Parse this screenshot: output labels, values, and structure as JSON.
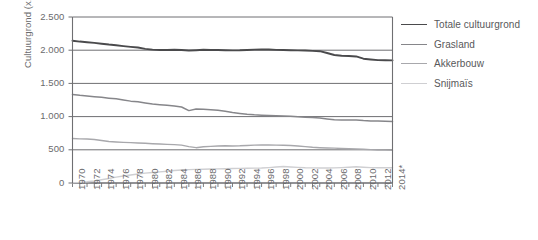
{
  "chart_data": {
    "type": "line",
    "title": "",
    "xlabel": "",
    "ylabel": "Cultuurgrond (x1.000 ha)",
    "ylim": [
      0,
      2500
    ],
    "ytick_labels": [
      "0",
      "500",
      "1.000",
      "1.500",
      "2.000",
      "2.500"
    ],
    "ytick_values": [
      0,
      500,
      1000,
      1500,
      2000,
      2500
    ],
    "grid": true,
    "legend_position": "right",
    "xlim": [
      1970,
      2014
    ],
    "x": [
      1970,
      1971,
      1972,
      1973,
      1974,
      1975,
      1976,
      1977,
      1978,
      1979,
      1980,
      1981,
      1982,
      1983,
      1984,
      1985,
      1986,
      1987,
      1988,
      1989,
      1990,
      1991,
      1992,
      1993,
      1994,
      1995,
      1996,
      1997,
      1998,
      1999,
      2000,
      2001,
      2002,
      2003,
      2004,
      2005,
      2006,
      2007,
      2008,
      2009,
      2010,
      2011,
      2012,
      2013,
      2014
    ],
    "xtick_labels": [
      "1970",
      "1971",
      "1972",
      "1973",
      "1974",
      "1975",
      "1976",
      "1977",
      "1978",
      "1979",
      "1980",
      "1981",
      "1982",
      "1983",
      "1984",
      "1985",
      "1986",
      "1987",
      "1988",
      "1989",
      "1990",
      "1991",
      "1992",
      "1993",
      "1994",
      "1995",
      "1996",
      "1997",
      "1998",
      "1999",
      "2000",
      "2001",
      "2002",
      "2003",
      "2004",
      "2005",
      "2006",
      "2007",
      "2008",
      "2009",
      "2010",
      "2011",
      "2012",
      "2013",
      "2014*"
    ],
    "xtick_labels_shown": [
      "1970",
      "1972",
      "1974",
      "1976",
      "1978",
      "1980",
      "1982",
      "1984",
      "1986",
      "1988",
      "1990",
      "1992",
      "1994",
      "1996",
      "1998",
      "2000",
      "2002",
      "2004",
      "2006",
      "2008",
      "2010",
      "2012",
      "2014*"
    ],
    "series": [
      {
        "name": "Totale cultuurgrond",
        "color": "#4a4a4c",
        "width": 1.9,
        "values": [
          2143,
          2130,
          2120,
          2110,
          2098,
          2085,
          2075,
          2062,
          2050,
          2040,
          2020,
          2008,
          2002,
          2004,
          2006,
          2003,
          1995,
          2000,
          2006,
          2003,
          2003,
          2000,
          1998,
          1999,
          2003,
          2008,
          2012,
          2010,
          2005,
          2003,
          2000,
          1998,
          1995,
          1990,
          1985,
          1958,
          1928,
          1917,
          1912,
          1906,
          1872,
          1861,
          1850,
          1848,
          1847
        ]
      },
      {
        "name": "Grasland",
        "color": "#86868a",
        "width": 1.5,
        "values": [
          1333,
          1320,
          1310,
          1300,
          1290,
          1278,
          1268,
          1250,
          1233,
          1222,
          1205,
          1190,
          1180,
          1170,
          1160,
          1145,
          1090,
          1113,
          1110,
          1105,
          1095,
          1080,
          1062,
          1048,
          1035,
          1026,
          1022,
          1018,
          1012,
          1008,
          1005,
          998,
          992,
          985,
          978,
          965,
          952,
          948,
          950,
          948,
          940,
          935,
          932,
          930,
          928
        ]
      },
      {
        "name": "Akkerbouw",
        "color": "#a8a8ac",
        "width": 1.4,
        "values": [
          670,
          665,
          662,
          655,
          640,
          625,
          618,
          612,
          608,
          602,
          598,
          592,
          588,
          582,
          578,
          570,
          548,
          532,
          545,
          552,
          558,
          560,
          558,
          560,
          565,
          570,
          573,
          572,
          570,
          568,
          565,
          558,
          548,
          538,
          532,
          528,
          525,
          520,
          515,
          512,
          508,
          502,
          498,
          495,
          492
        ]
      },
      {
        "name": "Snijmaïs",
        "color": "#cfcfd2",
        "width": 1.4,
        "values": [
          5,
          10,
          18,
          30,
          48,
          68,
          88,
          105,
          120,
          135,
          148,
          158,
          168,
          178,
          188,
          196,
          202,
          205,
          208,
          210,
          212,
          215,
          218,
          220,
          222,
          224,
          226,
          232,
          240,
          248,
          242,
          236,
          230,
          228,
          226,
          226,
          228,
          232,
          238,
          244,
          238,
          232,
          230,
          230,
          230
        ]
      }
    ]
  },
  "legend": {
    "items": [
      {
        "label": "Totale cultuurgrond",
        "color": "#4a4a4c",
        "width": "1.9px"
      },
      {
        "label": "Grasland",
        "color": "#86868a",
        "width": "1.5px"
      },
      {
        "label": "Akkerbouw",
        "color": "#a8a8ac",
        "width": "1.4px"
      },
      {
        "label": "Snijmaïs",
        "color": "#cfcfd2",
        "width": "1.4px"
      }
    ]
  },
  "axes": {
    "axis_color": "#6f6f72",
    "grid_color": "#6f6f72"
  }
}
